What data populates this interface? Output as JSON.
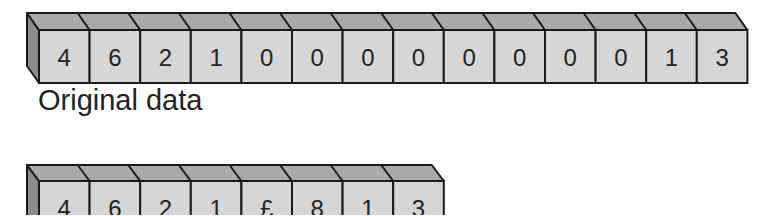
{
  "colors": {
    "front": "#d6d6d6",
    "top": "#a9a9a9",
    "side": "#8c8c8c",
    "stroke": "#1a1a1a"
  },
  "original": {
    "label": "Original data",
    "cells": [
      "4",
      "6",
      "2",
      "1",
      "0",
      "0",
      "0",
      "0",
      "0",
      "0",
      "0",
      "0",
      "1",
      "3"
    ]
  },
  "compressed": {
    "cells": [
      "4",
      "6",
      "2",
      "1",
      "£",
      "8",
      "1",
      "3"
    ]
  }
}
